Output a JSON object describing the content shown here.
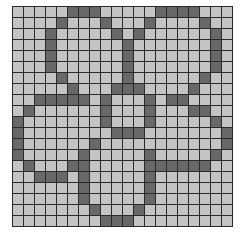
{
  "puzzle": {
    "rows": 20,
    "cols": 20,
    "colors": {
      "empty": "#c4c4c4",
      "filled": "#686868",
      "gridline": "#2a2a2a"
    },
    "filled_cells": [
      [
        5,
        6,
        7,
        13,
        14,
        15,
        16
      ],
      [
        4,
        8,
        12,
        17
      ],
      [
        3,
        9,
        11,
        18
      ],
      [
        3,
        10,
        18
      ],
      [
        3,
        10,
        18
      ],
      [
        3,
        10,
        18
      ],
      [
        4,
        10,
        17
      ],
      [
        5,
        9,
        10,
        11,
        16
      ],
      [
        2,
        3,
        4,
        5,
        6,
        8,
        12,
        14,
        15
      ],
      [
        1,
        8,
        12,
        16,
        17
      ],
      [
        0,
        8,
        12,
        18
      ],
      [
        0,
        9,
        10,
        11,
        19
      ],
      [
        0,
        7,
        19
      ],
      [
        0,
        6,
        12,
        18
      ],
      [
        1,
        5,
        6,
        12,
        13,
        14,
        15,
        16,
        17
      ],
      [
        2,
        3,
        4,
        6,
        12
      ],
      [
        6,
        12
      ],
      [
        6,
        12
      ],
      [
        7,
        11
      ],
      [
        8,
        9,
        10
      ]
    ]
  }
}
